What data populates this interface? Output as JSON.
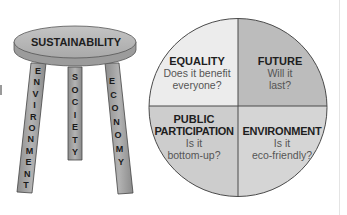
{
  "stool": {
    "seat_label": "SUSTAINABILITY",
    "legs": [
      {
        "label": "ENVIRONMENT",
        "letters": [
          "E",
          "N",
          "V",
          "I",
          "R",
          "O",
          "N",
          "M",
          "E",
          "N",
          "T"
        ]
      },
      {
        "label": "SOCIETY",
        "letters": [
          "S",
          "O",
          "C",
          "I",
          "E",
          "T",
          "Y"
        ]
      },
      {
        "label": "ECONOMY",
        "letters": [
          "E",
          "C",
          "O",
          "N",
          "O",
          "M",
          "Y"
        ]
      }
    ],
    "colors": {
      "seat": "#b9b9b9",
      "seat_edge": "#8e8e8e",
      "leg": "#a7a7a7",
      "outline": "#333333"
    }
  },
  "circle": {
    "quadrants": [
      {
        "position": "top-left",
        "title": "EQUALITY",
        "line1": "Does it benefit",
        "line2": "everyone?",
        "fill": "#ececec"
      },
      {
        "position": "top-right",
        "title": "FUTURE",
        "line1": "Will it",
        "line2": "last?",
        "fill": "#bcbcbc"
      },
      {
        "position": "bottom-left",
        "title_line1": "PUBLIC",
        "title_line2": "PARTICIPATION",
        "line1": "Is it",
        "line2": "bottom-up?",
        "fill": "#cdcdcd"
      },
      {
        "position": "bottom-right",
        "title": "ENVIRONMENT",
        "line1": "Is it",
        "line2": "eco-friendly?",
        "fill": "#d5d5d5"
      }
    ],
    "outline_color": "#4a4a4a"
  }
}
